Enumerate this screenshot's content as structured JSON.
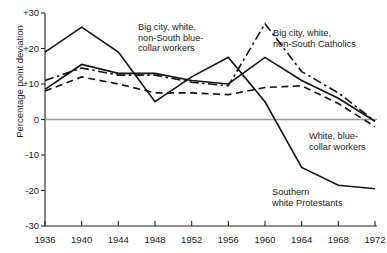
{
  "chart_data": {
    "type": "line",
    "title": "",
    "xlabel": "",
    "ylabel": "Percentage point deviation",
    "x": [
      1936,
      1940,
      1944,
      1948,
      1952,
      1956,
      1960,
      1964,
      1968,
      1972
    ],
    "xlim": [
      1936,
      1972
    ],
    "ylim": [
      -30,
      30
    ],
    "xticks": [
      "1936",
      "1940",
      "1944",
      "1948",
      "1952",
      "1956",
      "1960",
      "1964",
      "1968",
      "1972"
    ],
    "yticks": [
      "+30",
      "+20",
      "+10",
      "0",
      "-10",
      "-20",
      "-30"
    ],
    "ytick_values": [
      30,
      20,
      10,
      0,
      -10,
      -20,
      -30
    ],
    "grid": false,
    "legend": "inline-annotations",
    "zero_line": true,
    "series": [
      {
        "name": "Southern white Protestants",
        "style": "solid",
        "values": [
          19,
          26,
          19,
          5,
          12,
          17.5,
          5,
          -13.5,
          -18.5,
          -19.5
        ]
      },
      {
        "name": "Big city, white, non-South blue-collar workers",
        "style": "solid",
        "values": [
          8.5,
          15.5,
          13,
          13,
          11,
          10,
          17.5,
          11,
          6,
          -0.5
        ]
      },
      {
        "name": "Big city, white, non-South Catholics",
        "style": "dash-dot",
        "values": [
          11,
          14.5,
          12.5,
          12.5,
          10.5,
          9.5,
          27,
          13.5,
          7.5,
          -0.5
        ]
      },
      {
        "name": "White, blue-collar workers",
        "style": "dashed",
        "values": [
          8,
          12,
          10,
          7.5,
          7.5,
          7,
          9,
          9.5,
          4.5,
          -2
        ]
      }
    ],
    "annotations": [
      {
        "id": "annot-bigcity-bluecollar",
        "text": "Big city, white,\nnon-South blue-\ncollar workers",
        "x": 138,
        "y": 22,
        "align": "left"
      },
      {
        "id": "annot-bigcity-catholics",
        "text": "Big city, white,\nnon-South Catholics",
        "x": 273,
        "y": 28,
        "align": "left"
      },
      {
        "id": "annot-white-bluecollar",
        "text": "White, blue-\ncollar workers",
        "x": 309,
        "y": 131,
        "align": "left"
      },
      {
        "id": "annot-southern-protestants",
        "text": "Southern\nwhite Protestants",
        "x": 272,
        "y": 187,
        "align": "left"
      }
    ],
    "colors": {
      "line": "#111111",
      "axis": "#222222",
      "zero_line": "#999999",
      "background": "#ffffff"
    }
  },
  "geometry": {
    "x0": 45,
    "x1": 375,
    "y_top": 13,
    "y_bottom": 226,
    "v_top": 30,
    "v_bottom": -30
  }
}
